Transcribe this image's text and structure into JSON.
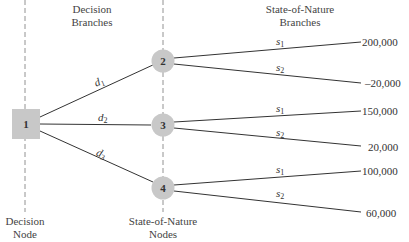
{
  "headers": {
    "decision_branches": [
      "Decision",
      "Branches"
    ],
    "state_of_nature_branches": [
      "State-of-Nature",
      "Branches"
    ],
    "decision_node": [
      "Decision",
      "Node"
    ],
    "state_of_nature_nodes": [
      "State-of-Nature",
      "Nodes"
    ]
  },
  "colors": {
    "node_fill": "#c8c8c8",
    "line": "#333333",
    "guide": "#666666"
  },
  "nodes": {
    "decision": {
      "id": "1",
      "label": "1"
    },
    "chance": [
      {
        "id": "2",
        "label": "2"
      },
      {
        "id": "3",
        "label": "3"
      },
      {
        "id": "4",
        "label": "4"
      }
    ]
  },
  "decision_branches": [
    {
      "label": "d",
      "sub": "1"
    },
    {
      "label": "d",
      "sub": "2"
    },
    {
      "label": "d",
      "sub": "3"
    }
  ],
  "state_branches": [
    {
      "label": "s",
      "sub": "1",
      "payoff": "200,000"
    },
    {
      "label": "s",
      "sub": "2",
      "payoff": "–20,000"
    },
    {
      "label": "s",
      "sub": "1",
      "payoff": "150,000"
    },
    {
      "label": "s",
      "sub": "2",
      "payoff": "20,000"
    },
    {
      "label": "s",
      "sub": "1",
      "payoff": "100,000"
    },
    {
      "label": "s",
      "sub": "2",
      "payoff": "60,000"
    }
  ]
}
